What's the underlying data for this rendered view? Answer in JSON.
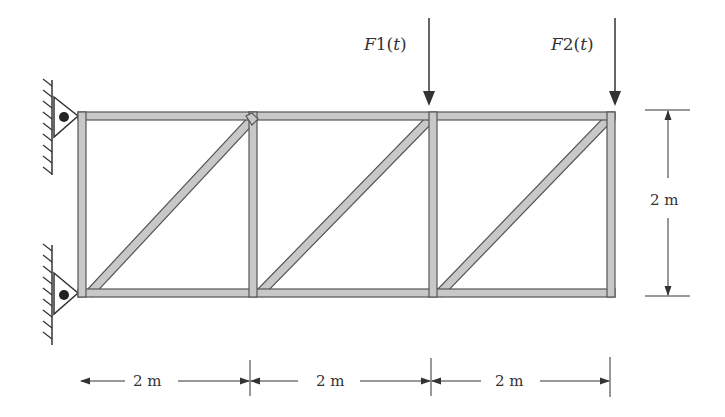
{
  "diagram": {
    "type": "truss",
    "bays": 3,
    "loads": [
      {
        "label": "F1(t)",
        "label_main": "F",
        "label_sub": "1(",
        "label_var": "t",
        "label_end": ")"
      },
      {
        "label": "F2(t)",
        "label_main": "F",
        "label_sub": "2(",
        "label_var": "t",
        "label_end": ")"
      }
    ],
    "dimensions": {
      "height_label": "2 m",
      "bay_labels": [
        "2 m",
        "2 m",
        "2 m"
      ]
    },
    "supports": [
      "pin-top-left",
      "pin-bottom-left"
    ],
    "colors": {
      "member_fill": "#c8c8c8",
      "member_stroke": "#555555",
      "line": "#333333"
    }
  }
}
